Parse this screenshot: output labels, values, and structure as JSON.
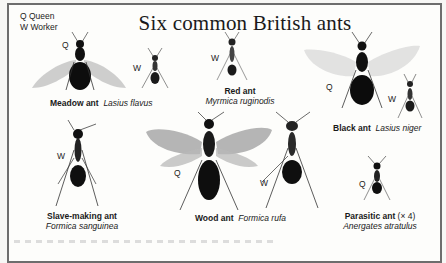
{
  "title": "Six common British ants",
  "legend": {
    "q": "Q Queen",
    "w": "W Worker"
  },
  "caste_labels": {
    "queen": "Q",
    "worker": "W"
  },
  "ants": [
    {
      "id": "meadow",
      "common": "Meadow ant",
      "latin": "Lasius flavus",
      "castes": [
        "Q",
        "W"
      ]
    },
    {
      "id": "red",
      "common": "Red ant",
      "latin": "Myrmica ruginodis",
      "castes": [
        "W"
      ]
    },
    {
      "id": "black",
      "common": "Black ant",
      "latin": "Lasius niger",
      "castes": [
        "Q",
        "W"
      ]
    },
    {
      "id": "slave",
      "common": "Slave-making ant",
      "latin": "Formica sanguinea",
      "castes": [
        "W"
      ]
    },
    {
      "id": "wood",
      "common": "Wood ant",
      "latin": "Formica rufa",
      "castes": [
        "Q",
        "W"
      ]
    },
    {
      "id": "parasitic",
      "common": "Parasitic ant",
      "scale": "(× 4)",
      "latin": "Anergates atratulus",
      "castes": [
        "Q"
      ]
    }
  ]
}
